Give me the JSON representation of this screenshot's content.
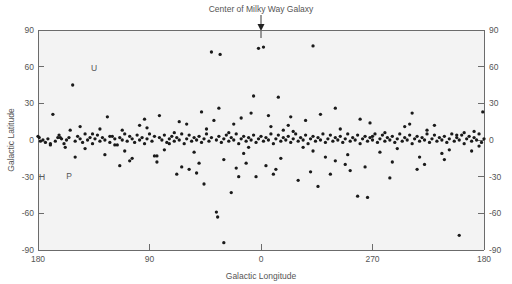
{
  "figure": {
    "title": "Center of Milky Way Galaxy",
    "title_marker": "down-arrow"
  },
  "annotations_labels": {
    "u": "U",
    "h": "H",
    "p": "P"
  },
  "chart_data": {
    "type": "scatter",
    "title": "Center of Milky Way Galaxy",
    "xlabel": "Galactic Longitude",
    "ylabel": "Galactic Latitude",
    "xlim": [
      180,
      -180
    ],
    "ylim": [
      -90,
      90
    ],
    "xticks": [
      180,
      90,
      0,
      270,
      180
    ],
    "xtick_labels": [
      "180",
      "90",
      "0",
      "270",
      "180"
    ],
    "yticks": [
      90,
      60,
      30,
      0,
      -30,
      -60,
      -90
    ],
    "ytick_labels": [
      "90",
      "60",
      "30",
      "0",
      "-30",
      "-60",
      "-90"
    ],
    "ytick_labels_right": [
      "90",
      "60",
      "30",
      "0",
      "-30",
      "-60",
      "-90"
    ],
    "grid": false,
    "legend": "none",
    "marker": "filled-circle",
    "marker_color": "#1a1a1a",
    "marker_size_px": 2.6,
    "background_color": "#f3f3f3",
    "axis_color": "#6b6b6b",
    "annotations": [
      {
        "text": "U",
        "x": 135,
        "y": 58
      },
      {
        "text": "H",
        "x": 177,
        "y": -27
      },
      {
        "text": "P",
        "x": 166,
        "y": -26
      }
    ],
    "series": [
      {
        "name": "sources",
        "points": [
          [
            180,
            3
          ],
          [
            179,
            2
          ],
          [
            178,
            -1
          ],
          [
            176,
            0
          ],
          [
            174,
            -2
          ],
          [
            172,
            1
          ],
          [
            170,
            -4
          ],
          [
            168,
            21
          ],
          [
            166,
            -1
          ],
          [
            164,
            2
          ],
          [
            163,
            4
          ],
          [
            161,
            1
          ],
          [
            159,
            -3
          ],
          [
            157,
            0
          ],
          [
            155,
            2
          ],
          [
            152,
            45
          ],
          [
            150,
            -1
          ],
          [
            148,
            3
          ],
          [
            146,
            1
          ],
          [
            144,
            -2
          ],
          [
            142,
            5
          ],
          [
            140,
            0
          ],
          [
            138,
            2
          ],
          [
            136,
            -3
          ],
          [
            134,
            1
          ],
          [
            132,
            4
          ],
          [
            130,
            -1
          ],
          [
            128,
            2
          ],
          [
            126,
            0
          ],
          [
            124,
            19
          ],
          [
            122,
            -2
          ],
          [
            120,
            3
          ],
          [
            118,
            1
          ],
          [
            116,
            -4
          ],
          [
            114,
            2
          ],
          [
            112,
            0
          ],
          [
            110,
            5
          ],
          [
            108,
            -1
          ],
          [
            106,
            3
          ],
          [
            104,
            1
          ],
          [
            102,
            -2
          ],
          [
            100,
            4
          ],
          [
            98,
            0
          ],
          [
            96,
            2
          ],
          [
            94,
            -3
          ],
          [
            92,
            1
          ],
          [
            90,
            5
          ],
          [
            88,
            -1
          ],
          [
            86,
            3
          ],
          [
            84,
            -13
          ],
          [
            82,
            2
          ],
          [
            80,
            0
          ],
          [
            78,
            4
          ],
          [
            76,
            -2
          ],
          [
            74,
            1
          ],
          [
            72,
            3
          ],
          [
            70,
            -1
          ],
          [
            68,
            2
          ],
          [
            66,
            0
          ],
          [
            64,
            5
          ],
          [
            62,
            -3
          ],
          [
            60,
            1
          ],
          [
            58,
            4
          ],
          [
            56,
            -1
          ],
          [
            54,
            2
          ],
          [
            52,
            0
          ],
          [
            50,
            3
          ],
          [
            48,
            -2
          ],
          [
            46,
            1
          ],
          [
            44,
            5
          ],
          [
            42,
            -1
          ],
          [
            40,
            2
          ],
          [
            38,
            16
          ],
          [
            36,
            0
          ],
          [
            34,
            3
          ],
          [
            32,
            -2
          ],
          [
            30,
            1
          ],
          [
            28,
            4
          ],
          [
            26,
            -1
          ],
          [
            24,
            2
          ],
          [
            22,
            0
          ],
          [
            20,
            5
          ],
          [
            18,
            -3
          ],
          [
            16,
            1
          ],
          [
            14,
            3
          ],
          [
            12,
            -1
          ],
          [
            10,
            2
          ],
          [
            8,
            0
          ],
          [
            6,
            4
          ],
          [
            4,
            -2
          ],
          [
            2,
            1
          ],
          [
            0,
            3
          ],
          [
            -2,
            -1
          ],
          [
            -4,
            2
          ],
          [
            -6,
            0
          ],
          [
            -8,
            5
          ],
          [
            -10,
            -3
          ],
          [
            -12,
            1
          ],
          [
            -14,
            4
          ],
          [
            -16,
            -1
          ],
          [
            -18,
            2
          ],
          [
            -20,
            0
          ],
          [
            -22,
            3
          ],
          [
            -24,
            -2
          ],
          [
            -26,
            1
          ],
          [
            -28,
            5
          ],
          [
            -30,
            -1
          ],
          [
            -32,
            2
          ],
          [
            -34,
            0
          ],
          [
            -36,
            4
          ],
          [
            -38,
            -3
          ],
          [
            -40,
            1
          ],
          [
            -42,
            3
          ],
          [
            -44,
            -1
          ],
          [
            -46,
            2
          ],
          [
            -48,
            0
          ],
          [
            -50,
            5
          ],
          [
            -52,
            -2
          ],
          [
            -54,
            1
          ],
          [
            -56,
            4
          ],
          [
            -58,
            -1
          ],
          [
            -60,
            2
          ],
          [
            -62,
            0
          ],
          [
            -64,
            3
          ],
          [
            -66,
            -2
          ],
          [
            -68,
            1
          ],
          [
            -70,
            5
          ],
          [
            -72,
            -1
          ],
          [
            -74,
            2
          ],
          [
            -76,
            0
          ],
          [
            -78,
            4
          ],
          [
            -80,
            -3
          ],
          [
            -82,
            1
          ],
          [
            -84,
            3
          ],
          [
            -86,
            -1
          ],
          [
            -88,
            2
          ],
          [
            -90,
            0
          ],
          [
            -92,
            5
          ],
          [
            -94,
            -2
          ],
          [
            -96,
            1
          ],
          [
            -98,
            4
          ],
          [
            -100,
            -1
          ],
          [
            -102,
            2
          ],
          [
            -104,
            0
          ],
          [
            -106,
            3
          ],
          [
            -108,
            -2
          ],
          [
            -110,
            1
          ],
          [
            -112,
            5
          ],
          [
            -114,
            -1
          ],
          [
            -116,
            2
          ],
          [
            -118,
            0
          ],
          [
            -120,
            4
          ],
          [
            -122,
            -3
          ],
          [
            -124,
            1
          ],
          [
            -126,
            3
          ],
          [
            -128,
            -1
          ],
          [
            -130,
            2
          ],
          [
            -132,
            0
          ],
          [
            -134,
            5
          ],
          [
            -136,
            -2
          ],
          [
            -138,
            1
          ],
          [
            -140,
            4
          ],
          [
            -142,
            -1
          ],
          [
            -144,
            2
          ],
          [
            -146,
            0
          ],
          [
            -148,
            3
          ],
          [
            -150,
            -2
          ],
          [
            -152,
            1
          ],
          [
            -154,
            5
          ],
          [
            -156,
            -1
          ],
          [
            -158,
            2
          ],
          [
            -160,
            0
          ],
          [
            -162,
            4
          ],
          [
            -164,
            -3
          ],
          [
            -166,
            1
          ],
          [
            -168,
            3
          ],
          [
            -170,
            -1
          ],
          [
            -172,
            2
          ],
          [
            -174,
            0
          ],
          [
            -176,
            5
          ],
          [
            -178,
            -2
          ],
          [
            -179,
            23
          ],
          [
            -180,
            1
          ],
          [
            40,
            72
          ],
          [
            33,
            70
          ],
          [
            2,
            75
          ],
          [
            -2,
            76
          ],
          [
            -42,
            77
          ],
          [
            6,
            36
          ],
          [
            -14,
            35
          ],
          [
            24,
            -43
          ],
          [
            -78,
            -46
          ],
          [
            -86,
            -47
          ],
          [
            46,
            -36
          ],
          [
            36,
            -59
          ],
          [
            35,
            -63
          ],
          [
            30,
            -84
          ],
          [
            -160,
            -78
          ],
          [
            52,
            -27
          ],
          [
            18,
            -30
          ],
          [
            -30,
            -33
          ],
          [
            -56,
            -28
          ],
          [
            -104,
            -31
          ],
          [
            -126,
            -24
          ],
          [
            64,
            -22
          ],
          [
            -10,
            -28
          ],
          [
            -46,
            -38
          ],
          [
            -72,
            -25
          ],
          [
            84,
            -18
          ],
          [
            -132,
            -20
          ],
          [
            150,
            -14
          ],
          [
            126,
            -12
          ],
          [
            -148,
            -16
          ],
          [
            -170,
            -9
          ],
          [
            112,
            8
          ],
          [
            92,
            10
          ],
          [
            -22,
            12
          ],
          [
            -64,
            9
          ],
          [
            -116,
            11
          ],
          [
            78,
            -8
          ],
          [
            -96,
            -10
          ],
          [
            158,
            -6
          ],
          [
            8,
            22
          ],
          [
            -6,
            20
          ],
          [
            16,
            18
          ],
          [
            -36,
            16
          ],
          [
            -88,
            14
          ],
          [
            60,
            13
          ],
          [
            -140,
            12
          ],
          [
            104,
            -15
          ],
          [
            -52,
            -14
          ],
          [
            44,
            9
          ],
          [
            -26,
            7
          ],
          [
            10,
            -6
          ],
          [
            -18,
            8
          ],
          [
            70,
            6
          ],
          [
            -110,
            -7
          ],
          [
            136,
            5
          ],
          [
            -158,
            4
          ],
          [
            118,
            -4
          ],
          [
            22,
            13
          ],
          [
            -70,
            -12
          ],
          [
            98,
            12
          ],
          [
            -134,
            8
          ],
          [
            54,
            -10
          ],
          [
            -42,
            -9
          ],
          [
            -8,
            11
          ],
          [
            14,
            -11
          ],
          [
            -100,
            6
          ],
          [
            142,
            -7
          ],
          [
            -176,
            -5
          ],
          [
            86,
            -13
          ],
          [
            -120,
            13
          ],
          [
            30,
            -16
          ],
          [
            -60,
            -17
          ],
          [
            110,
            -9
          ],
          [
            -80,
            17
          ],
          [
            -16,
            -15
          ],
          [
            66,
            15
          ],
          [
            -146,
            -11
          ],
          [
            50,
            -19
          ],
          [
            26,
            6
          ],
          [
            -34,
            -6
          ],
          [
            74,
            -3
          ],
          [
            -90,
            3
          ],
          [
            130,
            9
          ],
          [
            -152,
            -8
          ],
          [
            122,
            3
          ],
          [
            12,
            -19
          ],
          [
            -4,
            -21
          ],
          [
            -24,
            19
          ],
          [
            -68,
            -20
          ],
          [
            106,
            -17
          ],
          [
            -128,
            -14
          ],
          [
            94,
            17
          ],
          [
            58,
            -24
          ],
          [
            -48,
            21
          ],
          [
            20,
            -23
          ],
          [
            -12,
            -24
          ],
          [
            82,
            20
          ],
          [
            -106,
            -18
          ],
          [
            146,
            11
          ],
          [
            -164,
            6
          ],
          [
            170,
            -3
          ],
          [
            -60,
            26
          ],
          [
            48,
            23
          ],
          [
            -84,
            -22
          ],
          [
            114,
            -21
          ],
          [
            34,
            26
          ],
          [
            -40,
            -26
          ],
          [
            4,
            -30
          ],
          [
            68,
            -28
          ],
          [
            -122,
            22
          ],
          [
            154,
            8
          ],
          [
            -172,
            7
          ],
          [
            162,
            2
          ]
        ]
      }
    ]
  }
}
